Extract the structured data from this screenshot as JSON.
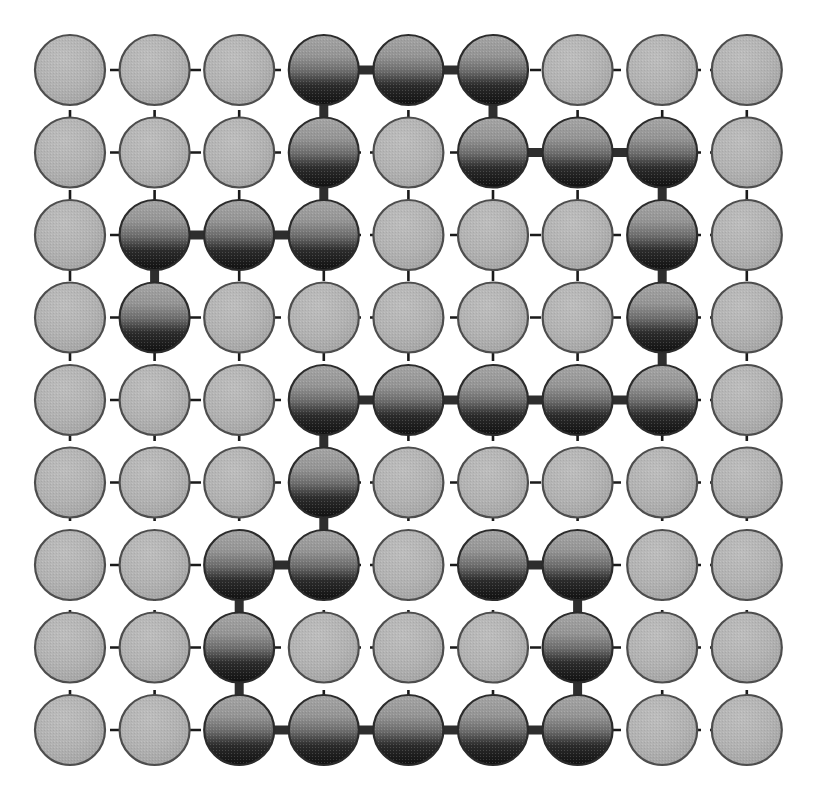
{
  "figure": {
    "background_color": "#ffffff"
  },
  "lattice": {
    "rows": 9,
    "cols": 9,
    "origin_x": 70,
    "origin_y": 70,
    "spacing_x": 84.6,
    "spacing_y": 82.5,
    "circle_radius": 35,
    "grid_line_color": "#1a1a1a",
    "grid_dash": "11 9",
    "grid_line_width": 2.6,
    "bond_color": "#2e2e2e",
    "bond_width": 9
  },
  "colors": {
    "empty_fill_top": "#b3b3b3",
    "empty_fill_bottom": "#a2a2a2",
    "empty_stroke": "#4d4d4d",
    "occupied_fill_top": "#9a9a9a",
    "occupied_fill_mid": "#6e6e6e",
    "occupied_fill_bottom": "#141414",
    "occupied_stroke": "#2b2b2b",
    "bond": "#2e2e2e",
    "grid": "#1a1a1a"
  },
  "chart_data": {
    "type": "scatter",
    "xlabel": "",
    "ylabel": "",
    "grid": true,
    "legend": null,
    "xlim": [
      1,
      9
    ],
    "ylim": [
      1,
      9
    ],
    "categories": [
      "empty-site",
      "occupied-site"
    ],
    "occupied_sites": [
      {
        "row": 1,
        "col": 4
      },
      {
        "row": 1,
        "col": 5
      },
      {
        "row": 1,
        "col": 6
      },
      {
        "row": 2,
        "col": 4
      },
      {
        "row": 2,
        "col": 6
      },
      {
        "row": 2,
        "col": 7
      },
      {
        "row": 2,
        "col": 8
      },
      {
        "row": 3,
        "col": 2
      },
      {
        "row": 3,
        "col": 3
      },
      {
        "row": 3,
        "col": 4
      },
      {
        "row": 3,
        "col": 8
      },
      {
        "row": 4,
        "col": 2
      },
      {
        "row": 4,
        "col": 8
      },
      {
        "row": 5,
        "col": 4
      },
      {
        "row": 5,
        "col": 5
      },
      {
        "row": 5,
        "col": 6
      },
      {
        "row": 5,
        "col": 7
      },
      {
        "row": 5,
        "col": 8
      },
      {
        "row": 6,
        "col": 4
      },
      {
        "row": 7,
        "col": 3
      },
      {
        "row": 7,
        "col": 4
      },
      {
        "row": 7,
        "col": 6
      },
      {
        "row": 7,
        "col": 7
      },
      {
        "row": 8,
        "col": 3
      },
      {
        "row": 8,
        "col": 7
      },
      {
        "row": 9,
        "col": 3
      },
      {
        "row": 9,
        "col": 4
      },
      {
        "row": 9,
        "col": 5
      },
      {
        "row": 9,
        "col": 6
      },
      {
        "row": 9,
        "col": 7
      }
    ],
    "bonds": [
      {
        "orientation": "h",
        "row": 1,
        "col": 4
      },
      {
        "orientation": "h",
        "row": 1,
        "col": 5
      },
      {
        "orientation": "v",
        "row": 1,
        "col": 4
      },
      {
        "orientation": "v",
        "row": 1,
        "col": 6
      },
      {
        "orientation": "h",
        "row": 2,
        "col": 6
      },
      {
        "orientation": "h",
        "row": 2,
        "col": 7
      },
      {
        "orientation": "v",
        "row": 2,
        "col": 4
      },
      {
        "orientation": "v",
        "row": 2,
        "col": 8
      },
      {
        "orientation": "h",
        "row": 3,
        "col": 2
      },
      {
        "orientation": "h",
        "row": 3,
        "col": 3
      },
      {
        "orientation": "v",
        "row": 3,
        "col": 2
      },
      {
        "orientation": "v",
        "row": 3,
        "col": 8
      },
      {
        "orientation": "v",
        "row": 4,
        "col": 8
      },
      {
        "orientation": "h",
        "row": 5,
        "col": 4
      },
      {
        "orientation": "h",
        "row": 5,
        "col": 5
      },
      {
        "orientation": "h",
        "row": 5,
        "col": 6
      },
      {
        "orientation": "h",
        "row": 5,
        "col": 7
      },
      {
        "orientation": "v",
        "row": 5,
        "col": 4
      },
      {
        "orientation": "v",
        "row": 6,
        "col": 4
      },
      {
        "orientation": "h",
        "row": 7,
        "col": 3
      },
      {
        "orientation": "h",
        "row": 7,
        "col": 6
      },
      {
        "orientation": "v",
        "row": 7,
        "col": 3
      },
      {
        "orientation": "v",
        "row": 7,
        "col": 7
      },
      {
        "orientation": "v",
        "row": 8,
        "col": 3
      },
      {
        "orientation": "v",
        "row": 8,
        "col": 7
      },
      {
        "orientation": "h",
        "row": 9,
        "col": 3
      },
      {
        "orientation": "h",
        "row": 9,
        "col": 4
      },
      {
        "orientation": "h",
        "row": 9,
        "col": 5
      },
      {
        "orientation": "h",
        "row": 9,
        "col": 6
      }
    ],
    "counts": {
      "total_sites": 81,
      "occupied_sites": 30,
      "empty_sites": 51,
      "bonds": 29
    }
  }
}
